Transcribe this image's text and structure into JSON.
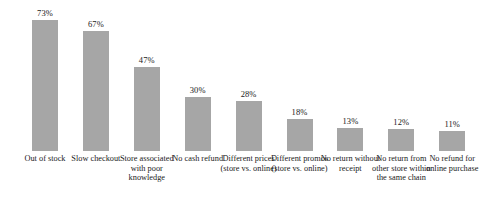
{
  "chart_data": {
    "type": "bar",
    "title": "",
    "subtitle": "",
    "xlabel": "",
    "ylabel": "",
    "ylim": [
      0,
      80
    ],
    "grid": false,
    "legend": null,
    "bar_color": "#a6a6a6",
    "value_suffix": "%",
    "categories": [
      "Out of stock",
      "Slow checkout",
      "Store associated with poor knowledge",
      "No cash refund",
      "Different prices (store vs. online)",
      "Different promos (store vs. online)",
      "No return without receipt",
      "No return from other store within the same chain",
      "No refund for online purchase"
    ],
    "values": [
      73,
      67,
      47,
      30,
      28,
      18,
      13,
      12,
      11
    ],
    "value_labels": [
      "73%",
      "67%",
      "47%",
      "30%",
      "28%",
      "18%",
      "13%",
      "12%",
      "11%"
    ]
  }
}
